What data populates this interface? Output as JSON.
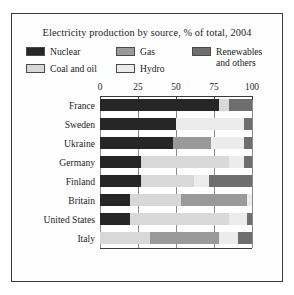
{
  "chart_data": {
    "type": "bar",
    "orientation": "horizontal",
    "stacked": true,
    "title": "Electricity production by source, % of total, 2004",
    "xlabel": "",
    "ylabel": "",
    "xlim": [
      0,
      100
    ],
    "xticks": [
      0,
      25,
      50,
      75,
      100
    ],
    "xticklabels": [
      "0",
      "25",
      "50",
      "75",
      "100"
    ],
    "grid": true,
    "legend_position": "top",
    "categories": [
      "France",
      "Sweden",
      "Ukraine",
      "Germany",
      "Finland",
      "Britain",
      "United States",
      "Italy"
    ],
    "series": [
      {
        "name": "Nuclear",
        "color": "#262626",
        "values": [
          78,
          50,
          48,
          27,
          27,
          20,
          20,
          0
        ]
      },
      {
        "name": "Coal and oil",
        "color": "#d8d8d8",
        "values": [
          7,
          0,
          0,
          58,
          35,
          33,
          65,
          33
        ]
      },
      {
        "name": "Gas",
        "color": "#9a9a9a",
        "values": [
          0,
          0,
          25,
          0,
          0,
          44,
          0,
          45
        ]
      },
      {
        "name": "Hydro",
        "color": "#ececec",
        "values": [
          0,
          45,
          22,
          10,
          10,
          3,
          12,
          13
        ]
      },
      {
        "name": "Renewables and others",
        "color": "#6e6e6e",
        "values": [
          15,
          5,
          5,
          5,
          28,
          0,
          3,
          9
        ]
      }
    ]
  },
  "legend": {
    "items": [
      {
        "label": "Nuclear",
        "color": "#262626"
      },
      {
        "label": "Coal and oil",
        "color": "#d8d8d8"
      },
      {
        "label": "Gas",
        "color": "#9a9a9a"
      },
      {
        "label": "Hydro",
        "color": "#ececec"
      },
      {
        "label": "Renewables and others",
        "color": "#6e6e6e"
      }
    ]
  },
  "colors": {
    "border": "#3a3a3a",
    "background": "#fefefe",
    "text": "#1d1d1d",
    "gridline": "#8a8a8a"
  }
}
